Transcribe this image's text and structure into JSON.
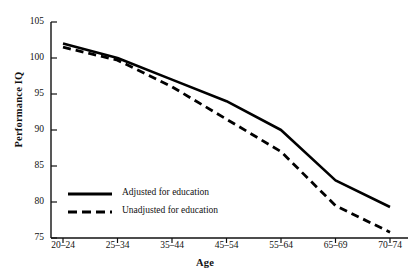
{
  "chart_data": {
    "type": "line",
    "title": "",
    "xlabel": "Age",
    "ylabel": "Performance IQ",
    "categories": [
      "20–24",
      "25–34",
      "35–44",
      "45–54",
      "55–64",
      "65–69",
      "70–74"
    ],
    "ylim": [
      75,
      105
    ],
    "yticks": [
      75,
      80,
      85,
      90,
      95,
      100,
      105
    ],
    "grid": false,
    "legend_position": "lower-left-inside",
    "series": [
      {
        "name": "Adjusted for education",
        "style": "solid",
        "color": "#000000",
        "values": [
          102.0,
          100.0,
          97.0,
          94.0,
          90.0,
          83.0,
          79.3
        ]
      },
      {
        "name": "Unadjusted for education",
        "style": "dashed",
        "color": "#000000",
        "values": [
          101.5,
          99.7,
          96.0,
          91.5,
          87.0,
          79.5,
          75.8
        ]
      }
    ]
  },
  "axis": {
    "y_tick_labels": [
      "105",
      "100",
      "95",
      "90",
      "85",
      "80",
      "75"
    ],
    "x_tick_labels": [
      "20–24",
      "25–34",
      "35–44",
      "45–54",
      "55–64",
      "65–69",
      "70–74"
    ],
    "y_title": "Performance IQ",
    "x_title": "Age"
  },
  "legend": {
    "entries": [
      {
        "label": "Adjusted for education",
        "style": "solid"
      },
      {
        "label": "Unadjusted for education",
        "style": "dashed"
      }
    ]
  }
}
